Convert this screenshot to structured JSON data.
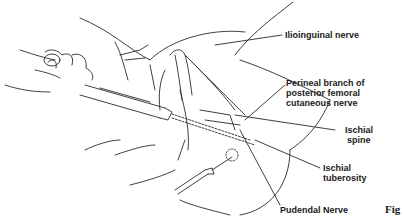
{
  "figure": {
    "labels": {
      "ilioinguinal": "Ilioinguinal nerve",
      "perineal_1": "Perineal branch of",
      "perineal_2": "posterior femoral",
      "perineal_3": "cutaneous nerve",
      "ischial_spine_1": "Ischial",
      "ischial_spine_2": "spine",
      "ischial_tuberosity_1": "Ischial",
      "ischial_tuberosity_2": "tuberosity",
      "pudendal": "Pudendal Nerve"
    },
    "caption": "Fig",
    "line_color": "#2a2a2a"
  }
}
